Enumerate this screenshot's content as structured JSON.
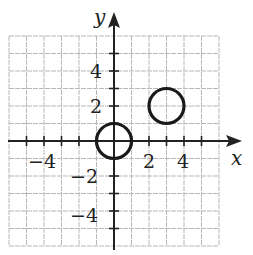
{
  "chart_data": {
    "type": "scatter",
    "title": "",
    "xlabel": "x",
    "ylabel": "y",
    "xlim": [
      -6,
      6
    ],
    "ylim": [
      -6,
      6
    ],
    "grid": true,
    "grid_step": 1,
    "x_tick_labels": [
      "-4",
      "2",
      "4"
    ],
    "y_tick_labels": [
      "4",
      "2",
      "-2",
      "-4"
    ],
    "series": [
      {
        "name": "circle A",
        "shape": "circle",
        "center": [
          0,
          0
        ],
        "radius": 1
      },
      {
        "name": "circle B",
        "shape": "circle",
        "center": [
          3,
          2
        ],
        "radius": 1
      }
    ]
  },
  "axes": {
    "x_label": "x",
    "y_label": "y",
    "x_tick_labels": [
      {
        "text": "−4",
        "value": -4
      },
      {
        "text": "2",
        "value": 2
      },
      {
        "text": "4",
        "value": 4
      }
    ],
    "y_tick_labels": [
      {
        "text": "4",
        "value": 4
      },
      {
        "text": "2",
        "value": 2
      },
      {
        "text": "−2",
        "value": -2
      },
      {
        "text": "−4",
        "value": -4
      }
    ]
  },
  "colors": {
    "grid": "#b8b8b8",
    "axis": "#222222",
    "curve": "#1a1a1a"
  }
}
